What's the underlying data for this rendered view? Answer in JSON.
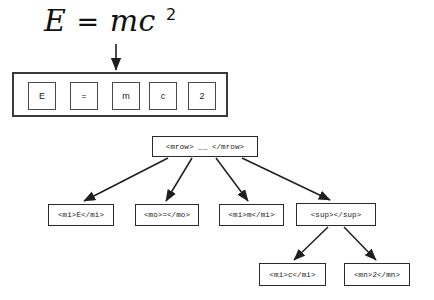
{
  "diagram": {
    "title_formula": {
      "full_text": "E = mc 2",
      "lhs": "E",
      "operator": "=",
      "base": "mc",
      "exponent": "2"
    },
    "token_strip": {
      "name": "token-strip",
      "tokens": [
        {
          "label": "E"
        },
        {
          "label": "="
        },
        {
          "label": "m"
        },
        {
          "label": "c"
        },
        {
          "label": "2"
        }
      ]
    },
    "tree": {
      "root": {
        "label": "<mrow> __ </mrow>"
      },
      "children": [
        {
          "label": "<mi>E</mi>"
        },
        {
          "label": "<mo>=</mo>"
        },
        {
          "label": "<mi>m</mi>"
        },
        {
          "label": "<sup></sup>"
        }
      ],
      "grandchildren": [
        {
          "label": "<mi>c</mi>"
        },
        {
          "label": "<mn>2</mn>"
        }
      ]
    },
    "colors": {
      "background": "#ffffff",
      "stroke": "#2b2b2b",
      "strip_stroke": "#3a3a3a",
      "text": "#1a1a1a"
    }
  }
}
